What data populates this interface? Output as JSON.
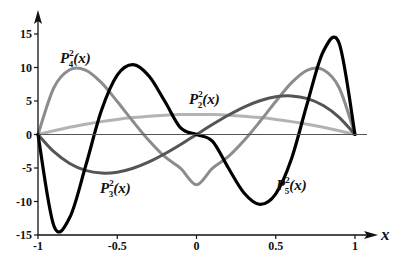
{
  "chart_data": {
    "type": "line",
    "title": "",
    "xlabel": "x",
    "ylabel": "",
    "xlim": [
      -1,
      1
    ],
    "ylim": [
      -15,
      15
    ],
    "grid": false,
    "x_ticks": [
      -1,
      -0.5,
      0,
      0.5,
      1
    ],
    "x_tick_labels": [
      "-1",
      "-0.5",
      "0",
      "0.5",
      "1"
    ],
    "y_ticks": [
      -15,
      -10,
      -5,
      0,
      5,
      10,
      15
    ],
    "y_tick_labels": [
      "-15",
      "-10",
      "-5",
      "0",
      "5",
      "10",
      "15"
    ],
    "x": [
      -1,
      -0.9,
      -0.8,
      -0.7,
      -0.6,
      -0.5,
      -0.4,
      -0.3,
      -0.2,
      -0.1,
      0,
      0.1,
      0.2,
      0.3,
      0.4,
      0.5,
      0.6,
      0.7,
      0.8,
      0.9,
      1
    ],
    "series": [
      {
        "name": "P_2^2(x)",
        "label_main": "P",
        "label_sup": "2",
        "label_sub": "2",
        "label_tail": "(x)",
        "color": "#b3b3b3",
        "width": 3,
        "values": [
          0,
          0.57,
          1.08,
          1.53,
          1.92,
          2.25,
          2.52,
          2.73,
          2.88,
          2.97,
          3,
          2.97,
          2.88,
          2.73,
          2.52,
          2.25,
          1.92,
          1.53,
          1.08,
          0.57,
          0
        ]
      },
      {
        "name": "P_3^2(x)",
        "label_main": "P",
        "label_sup": "2",
        "label_sub": "3",
        "label_tail": "(x)",
        "color": "#555555",
        "width": 3,
        "values": [
          0,
          -2.57,
          -4.32,
          -5.36,
          -5.76,
          -5.63,
          -5.04,
          -4.1,
          -2.88,
          -1.49,
          0,
          1.49,
          2.88,
          4.1,
          5.04,
          5.63,
          5.76,
          5.36,
          4.32,
          2.57,
          0
        ]
      },
      {
        "name": "P_4^2(x)",
        "label_main": "P",
        "label_sup": "2",
        "label_sub": "4",
        "label_tail": "(x)",
        "color": "#8c8c8c",
        "width": 3,
        "values": [
          0,
          6.98,
          9.67,
          9.62,
          7.74,
          4.92,
          1.93,
          -0.9,
          -3.31,
          -5.05,
          -7.5,
          -5.05,
          -3.31,
          -0.9,
          1.93,
          4.92,
          7.74,
          9.62,
          9.67,
          6.98,
          0
        ]
      },
      {
        "name": "P_5^2(x)",
        "label_main": "P",
        "label_sup": "2",
        "label_sub": "5",
        "label_tail": "(x)",
        "color": "#000000",
        "width": 3.2,
        "values": [
          0,
          -13.62,
          -12.4,
          -4.75,
          3.57,
          8.86,
          10.42,
          8.73,
          4.96,
          0.99,
          0,
          -0.99,
          -4.96,
          -8.73,
          -10.42,
          -8.86,
          -3.57,
          4.75,
          12.4,
          13.62,
          0
        ]
      }
    ]
  },
  "labels": {
    "p4": {
      "x": 60,
      "y": 63
    },
    "p2": {
      "x": 189,
      "y": 104
    },
    "p3": {
      "x": 100,
      "y": 193
    },
    "p5": {
      "x": 276,
      "y": 190
    }
  }
}
